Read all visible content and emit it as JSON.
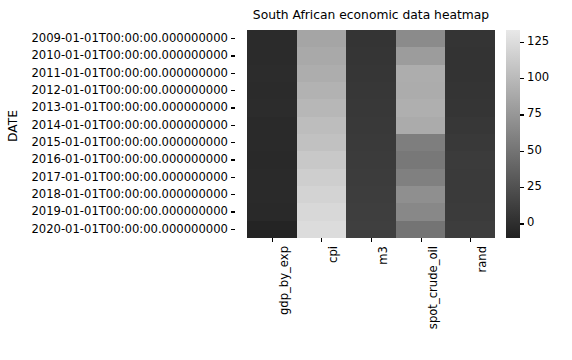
{
  "chart_data": {
    "type": "heatmap",
    "title": "South African economic data heatmap",
    "xlabel": "",
    "ylabel": "DATE",
    "colormap": "gray",
    "grid": false,
    "legend_position": "right-colorbar",
    "columns": [
      "gdp_by_exp",
      "cpi",
      "m3",
      "spot_crude_oil",
      "rand"
    ],
    "rows": [
      "2009-01-01T00:00:00.000000000",
      "2010-01-01T00:00:00.000000000",
      "2011-01-01T00:00:00.000000000",
      "2012-01-01T00:00:00.000000000",
      "2013-01-01T00:00:00.000000000",
      "2014-01-01T00:00:00.000000000",
      "2015-01-01T00:00:00.000000000",
      "2016-01-01T00:00:00.000000000",
      "2017-01-01T00:00:00.000000000",
      "2018-01-01T00:00:00.000000000",
      "2019-01-01T00:00:00.000000000",
      "2020-01-01T00:00:00.000000000"
    ],
    "values": [
      [
        2.1,
        76.0,
        12.5,
        61.7,
        8.4
      ],
      [
        3.0,
        79.4,
        14.0,
        79.5,
        7.3
      ],
      [
        3.3,
        83.4,
        15.2,
        95.0,
        7.3
      ],
      [
        2.2,
        88.1,
        16.1,
        94.1,
        8.2
      ],
      [
        2.5,
        93.2,
        17.2,
        97.9,
        9.6
      ],
      [
        1.8,
        99.0,
        18.3,
        93.2,
        10.9
      ],
      [
        1.2,
        103.5,
        19.4,
        48.7,
        12.8
      ],
      [
        0.4,
        110.0,
        20.3,
        43.2,
        14.7
      ],
      [
        1.4,
        115.9,
        21.1,
        50.8,
        13.3
      ],
      [
        0.8,
        121.2,
        22.0,
        65.2,
        13.2
      ],
      [
        0.2,
        126.1,
        22.8,
        57.0,
        14.4
      ],
      [
        -6.4,
        129.9,
        24.0,
        39.2,
        16.5
      ]
    ],
    "cell_colors": [
      [
        "#2b2b2b",
        "#a5a5a5",
        "#343434",
        "#8b8b8b",
        "#343434"
      ],
      [
        "#2b2b2b",
        "#a9a9a9",
        "#353535",
        "#9c9c9c",
        "#333333"
      ],
      [
        "#2c2c2c",
        "#adadad",
        "#363636",
        "#adadad",
        "#333333"
      ],
      [
        "#2b2b2b",
        "#b2b2b2",
        "#373737",
        "#acacac",
        "#343434"
      ],
      [
        "#2c2c2c",
        "#b7b7b7",
        "#383838",
        "#afafaf",
        "#353535"
      ],
      [
        "#2a2a2a",
        "#bdbdbd",
        "#393939",
        "#ababab",
        "#373737"
      ],
      [
        "#2a2a2a",
        "#c1c1c1",
        "#3a3a3a",
        "#7e7e7e",
        "#393939"
      ],
      [
        "#292929",
        "#c8c8c8",
        "#3b3b3b",
        "#787878",
        "#3b3b3b"
      ],
      [
        "#2a2a2a",
        "#cecece",
        "#3c3c3c",
        "#808080",
        "#3a3a3a"
      ],
      [
        "#2a2a2a",
        "#d3d3d3",
        "#3d3d3d",
        "#8f8f8f",
        "#3a3a3a"
      ],
      [
        "#292929",
        "#d8d8d8",
        "#3e3e3e",
        "#888888",
        "#3b3b3b"
      ],
      [
        "#242424",
        "#dcdcdc",
        "#3f3f3f",
        "#747474",
        "#3d3d3d"
      ]
    ],
    "colorbar": {
      "ticks": [
        0,
        25,
        50,
        75,
        100,
        125
      ],
      "tick_labels": [
        "0",
        "25",
        "50",
        "75",
        "100",
        "125"
      ],
      "vmin": -10,
      "vmax": 133,
      "low_color": "#202020",
      "high_color": "#e8e8e8"
    }
  }
}
